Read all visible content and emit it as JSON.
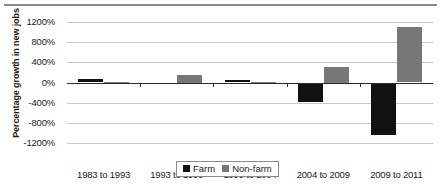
{
  "chart_data": {
    "type": "bar",
    "title": "",
    "xlabel": "",
    "ylabel": "Percentage growth in new jobs",
    "categories": [
      "1983 to 1993",
      "1993 to 1999",
      "1999 to 2004",
      "2004 to 2009",
      "2009 to 2011"
    ],
    "series": [
      {
        "name": "Farm",
        "color": "#111111",
        "values": [
          60,
          -10,
          40,
          -380,
          -1050
        ]
      },
      {
        "name": "Non-farm",
        "color": "#777777",
        "values": [
          15,
          150,
          10,
          300,
          1100
        ]
      }
    ],
    "ylim": [
      -1200,
      1200
    ],
    "ytick_labels": [
      "1200%",
      "800%",
      "400%",
      "0%",
      "-400%",
      "-800%",
      "-1200%"
    ],
    "ytick_values": [
      1200,
      800,
      400,
      0,
      -400,
      -800,
      -1200
    ],
    "grid": true,
    "legend_position": "bottom-center",
    "legend_entries": [
      "Farm",
      "Non-farm"
    ]
  }
}
